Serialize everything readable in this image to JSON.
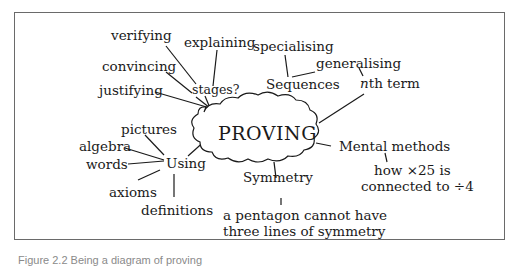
{
  "diagram": {
    "center": "PROVING",
    "branches": {
      "stages": {
        "label": "stages?",
        "children": [
          "verifying",
          "explaining",
          "convincing",
          "justifying"
        ]
      },
      "sequences": {
        "label": "Sequences",
        "children": [
          "specialising",
          "generalising"
        ]
      },
      "nth_term": {
        "label_italic": "n",
        "label_rest": "th term"
      },
      "mental": {
        "label": "Mental methods",
        "detail_line1": "how ×25 is",
        "detail_line2": "connected to ÷4"
      },
      "symmetry": {
        "label": "Symmetry",
        "detail_line1": "a pentagon cannot have",
        "detail_line2": "three lines of symmetry"
      },
      "using": {
        "label": "Using",
        "children": [
          "pictures",
          "algebra",
          "words",
          "axioms",
          "definitions"
        ]
      }
    }
  },
  "caption": "Figure 2.2  Being a diagram of proving"
}
